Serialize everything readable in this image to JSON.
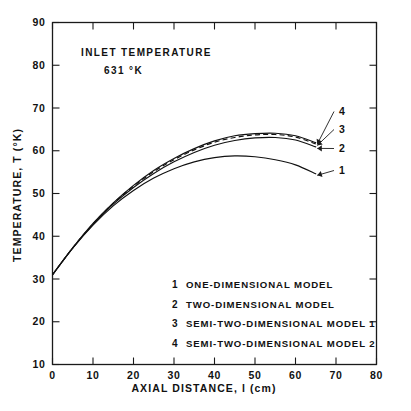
{
  "chart_data": {
    "type": "line",
    "title": "",
    "xlabel": "AXIAL DISTANCE, l (cm)",
    "ylabel": "TEMPERATURE, T (°K)",
    "xlim": [
      0,
      80
    ],
    "ylim": [
      10,
      90
    ],
    "xticks": [
      "0",
      "10",
      "20",
      "30",
      "40",
      "50",
      "60",
      "70",
      "80"
    ],
    "yticks": [
      "10",
      "20",
      "30",
      "40",
      "50",
      "60",
      "70",
      "80",
      "90"
    ],
    "xtick_values": [
      0,
      10,
      20,
      30,
      40,
      50,
      60,
      70,
      80
    ],
    "ytick_values": [
      10,
      20,
      30,
      40,
      50,
      60,
      70,
      80,
      90
    ],
    "grid": false,
    "legend_position": "inside-lower-center",
    "annotations": [
      {
        "name": "inlet-temperature-label",
        "line1": "INLET TEMPERATURE",
        "line2": "631 °K"
      }
    ],
    "x": [
      0,
      5,
      10,
      15,
      20,
      25,
      30,
      35,
      40,
      45,
      50,
      55,
      60,
      65
    ],
    "series": [
      {
        "name": "1",
        "label": "ONE-DIMENSIONAL MODEL",
        "style": "solid",
        "values": [
          31.0,
          37.2,
          42.6,
          47.1,
          50.7,
          53.6,
          55.8,
          57.4,
          58.4,
          58.8,
          58.6,
          57.9,
          56.7,
          54.6
        ]
      },
      {
        "name": "2",
        "label": "TWO-DIMENSIONAL MODEL",
        "style": "solid",
        "values": [
          31.0,
          37.3,
          42.8,
          47.5,
          51.4,
          54.7,
          57.4,
          59.6,
          61.3,
          62.4,
          63.0,
          63.1,
          62.5,
          60.9
        ]
      },
      {
        "name": "3",
        "label": "SEMI-TWO-DIMENSIONAL MODEL 1",
        "style": "dashed",
        "values": [
          31.0,
          37.3,
          42.9,
          47.7,
          51.7,
          55.1,
          57.9,
          60.2,
          62.0,
          63.1,
          63.7,
          63.8,
          63.2,
          61.6
        ]
      },
      {
        "name": "4",
        "label": "SEMI-TWO-DIMENSIONAL MODEL 2",
        "style": "solid",
        "values": [
          31.0,
          37.3,
          43.0,
          47.8,
          51.9,
          55.4,
          58.2,
          60.5,
          62.3,
          63.5,
          64.0,
          64.1,
          63.5,
          61.9
        ]
      }
    ],
    "curve_end_labels": [
      "1",
      "2",
      "3",
      "4"
    ]
  },
  "legend": {
    "entries": [
      {
        "num": "1",
        "label": "ONE-DIMENSIONAL MODEL"
      },
      {
        "num": "2",
        "label": "TWO-DIMENSIONAL MODEL"
      },
      {
        "num": "3",
        "label": "SEMI-TWO-DIMENSIONAL MODEL 1"
      },
      {
        "num": "4",
        "label": "SEMI-TWO-DIMENSIONAL MODEL 2"
      }
    ]
  },
  "colors": {
    "ink": "#111111",
    "background": "#ffffff"
  }
}
